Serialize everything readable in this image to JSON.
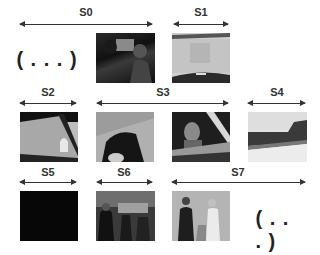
{
  "shots": [
    {
      "id": "S0",
      "label": "S0"
    },
    {
      "id": "S1",
      "label": "S1"
    },
    {
      "id": "S2",
      "label": "S2"
    },
    {
      "id": "S3",
      "label": "S3"
    },
    {
      "id": "S4",
      "label": "S4"
    },
    {
      "id": "S5",
      "label": "S5"
    },
    {
      "id": "S6",
      "label": "S6"
    },
    {
      "id": "S7",
      "label": "S7"
    }
  ],
  "ellipsis": {
    "start": "( . . . )",
    "end": "( . . . )"
  },
  "keyframes": [
    {
      "shot": "S0",
      "desc": "dark indoor scene, two people"
    },
    {
      "shot": "S1",
      "desc": "light gray car windshield view"
    },
    {
      "shot": "S2",
      "desc": "car window, hand waving"
    },
    {
      "shot": "S3",
      "desc": "car interior close-up, dark figure"
    },
    {
      "shot": "S3",
      "desc": "man looking out car window"
    },
    {
      "shot": "S4",
      "desc": "car exterior, landscape"
    },
    {
      "shot": "S5",
      "desc": "black frame"
    },
    {
      "shot": "S6",
      "desc": "crowd of people at a party"
    },
    {
      "shot": "S7",
      "desc": "man and woman talking"
    }
  ]
}
